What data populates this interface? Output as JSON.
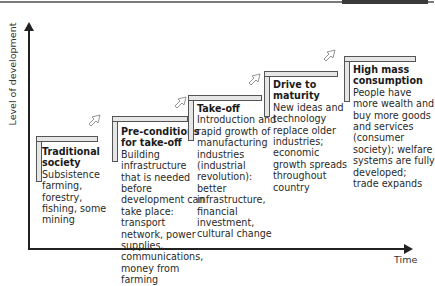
{
  "diagram": {
    "axes": {
      "y_label": "Level of development",
      "x_label": "Time"
    },
    "stages": [
      {
        "title": "Traditional society",
        "description": "Subsistence farming, forestry, fishing, some mining"
      },
      {
        "title": "Pre-conditions for take-off",
        "description": "Building infrastructure that is needed before development can take place: transport network, power supplies, communications, money from farming"
      },
      {
        "title": "Take-off",
        "description": "Introduction and rapid growth of manufacturing industries (industrial revolution): better infrastructure, financial investment, cultural change"
      },
      {
        "title": "Drive to maturity",
        "description": "New ideas and technology replace older industries; economic growth spreads throughout country"
      },
      {
        "title": "High mass consumption",
        "description": "People have more wealth and buy more goods and services (consumer society); welfare systems are fully developed; trade expands"
      }
    ],
    "colors": {
      "bracket_fill": "#e6e6e6",
      "bracket_border": "#555555",
      "axis": "#222222",
      "text": "#1a1a1a"
    }
  }
}
